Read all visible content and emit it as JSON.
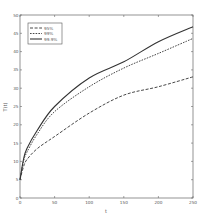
{
  "chart_data": {
    "type": "line",
    "title": "",
    "xlabel": "t",
    "ylabel": "T(t)",
    "xlim": [
      0,
      250
    ],
    "ylim": [
      0,
      50
    ],
    "xticks": [
      0,
      50,
      100,
      150,
      200,
      250
    ],
    "yticks": [
      0,
      5,
      10,
      15,
      20,
      25,
      30,
      35,
      40,
      45,
      50
    ],
    "grid": false,
    "legend_position": "upper left",
    "x": [
      0,
      5,
      10,
      25,
      50,
      100,
      150,
      200,
      250
    ],
    "series": [
      {
        "name": "95%",
        "style": "dashed",
        "values": [
          5,
          8.5,
          10.5,
          13.5,
          16.8,
          23.2,
          28.1,
          30.4,
          33.1
        ]
      },
      {
        "name": "99%",
        "style": "dotted",
        "values": [
          5,
          10,
          12.5,
          17.5,
          23.6,
          30.4,
          35.5,
          39.5,
          43.6
        ]
      },
      {
        "name": "99.9%",
        "style": "solid",
        "values": [
          5,
          10.5,
          13.5,
          18.5,
          25,
          32.8,
          37.2,
          42.7,
          46.8
        ]
      }
    ]
  }
}
